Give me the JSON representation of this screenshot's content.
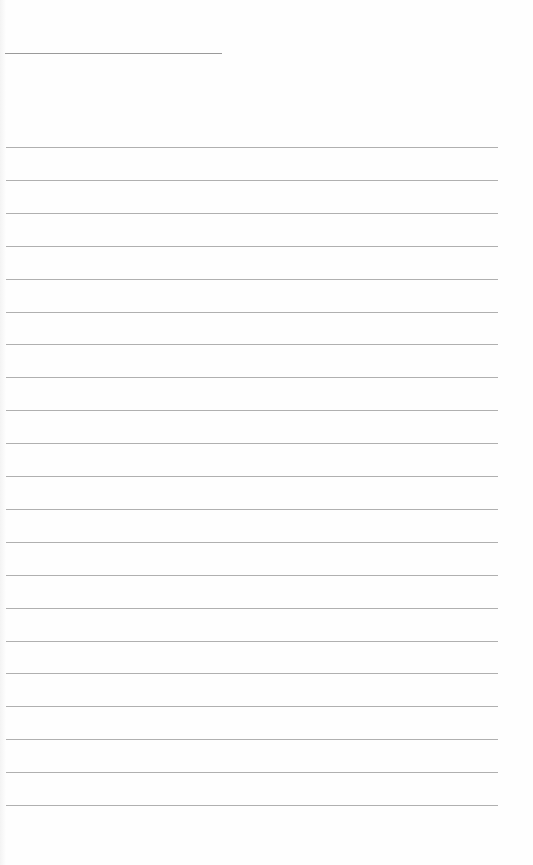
{
  "page": {
    "type": "lined-paper",
    "background": "#fefefe",
    "line_color": "#b0b0b0",
    "title_line": {
      "x": 5,
      "y": 53,
      "width": 217
    },
    "rules": {
      "count": 21,
      "start_y": 147,
      "spacing": 32.9,
      "x": 6,
      "width": 492
    }
  }
}
